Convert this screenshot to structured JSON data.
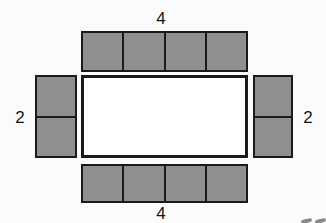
{
  "diagram": {
    "background_color": "#fbfbfb",
    "face_fill_color": "#8f8f8f",
    "base_fill_color": "#ffffff",
    "stroke_color": "#1a1a1a",
    "base": {
      "name": "base-rectangle",
      "x": 81,
      "y": 75,
      "width": 167,
      "height": 83,
      "fill": "#ffffff"
    },
    "strips": [
      {
        "id": "top-strip",
        "orientation": "horizontal",
        "cell_count": 4,
        "x": 81,
        "y": 31,
        "width": 167,
        "height": 41,
        "label": "4"
      },
      {
        "id": "bottom-strip",
        "orientation": "horizontal",
        "cell_count": 4,
        "x": 81,
        "y": 164,
        "width": 167,
        "height": 39,
        "label": "4"
      },
      {
        "id": "left-strip",
        "orientation": "vertical",
        "cell_count": 2,
        "x": 35,
        "y": 75,
        "width": 42,
        "height": 83,
        "label": "2"
      },
      {
        "id": "right-strip",
        "orientation": "vertical",
        "cell_count": 2,
        "x": 253,
        "y": 75,
        "width": 40,
        "height": 83,
        "label": "2"
      }
    ],
    "labels": {
      "top": "4",
      "bottom": "4",
      "left": "2",
      "right": "2"
    }
  }
}
